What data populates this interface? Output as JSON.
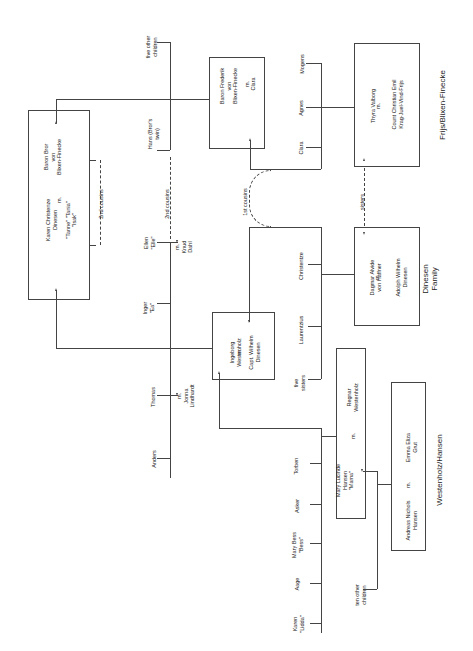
{
  "diagram": {
    "type": "family-tree",
    "orientation": "rotated-90-ccw",
    "families": {
      "frijs_blixen": "Frijs/Blixen-Finecke",
      "dinesen": "Dinesen\nFamily",
      "westenholz_hansen": "Westenholz/Hansen"
    },
    "couples": {
      "karen_bror": {
        "person1": "Karen Christenze\nDinesen\n\n\"Tanne\" \"Tania\"\n\"Isak\"",
        "m": "m.",
        "person2": "Baron Bror\nvon\nBlixen-Finecke"
      },
      "frederik_clara": {
        "person1": "Baron Frederik\nvon\nBlixen-Finecke",
        "m": "m.",
        "person2": "Clara"
      },
      "thyra_emil": {
        "person1": "Thyra Valborg",
        "m": "m.",
        "person2": "Count Christian Emil\nKrag-Juel-Vind-Frijs"
      },
      "ingeborg_wilhelm": {
        "person1": "Ingeborg\nWestenholz",
        "m": "m.",
        "person2": "Capt. Wilhelm\nDinesen"
      },
      "dagmar_adolph": {
        "person1": "Dagmar Alvide\nvon Haffner",
        "m": "m.",
        "person2": "Adolph Wilhelm\nDinesen"
      },
      "mary_regnar": {
        "person1": "Mary Lucinde\nHansen\n\"Mama\"",
        "m": "m.",
        "person2": "Regnar\nWestenholz"
      },
      "andreas_emma": {
        "person1": "Andreas Nichols\nHansen",
        "m": "m.",
        "person2": "Emma Eliza\nGrut"
      }
    },
    "individuals": {
      "five_other_children": "five other\nchildren",
      "hans": "Hans (Bror's\ntwin)",
      "mogens": "Mogens",
      "agnes": "Agnes",
      "clara_child": "Clara",
      "ellen": "Ellen\n\"Elle\"",
      "knud": "m.\nKnud\nDahl",
      "inger": "Inger\n\"Ea\"",
      "thomas": "Thomas",
      "jonna": "m.\nJonna\nLindhardt",
      "anders": "Anders",
      "christentze": "Christentze",
      "laurentzius": "Laurentzius",
      "five_sisters": "five\nsisters",
      "torben": "Torben",
      "asker": "Asker",
      "mary_bess": "Mary Bess\n\"Bess\"",
      "aage": "Aage",
      "karen_lidda": "Karen\n\"Lidda\"",
      "ten_other_children": "ten other\nchildren"
    },
    "relations": {
      "second_cousins_1": "2nd cousins",
      "second_cousins_2": "2nd cousins",
      "first_cousins": "1st cousins",
      "sisters": "sisters"
    }
  }
}
